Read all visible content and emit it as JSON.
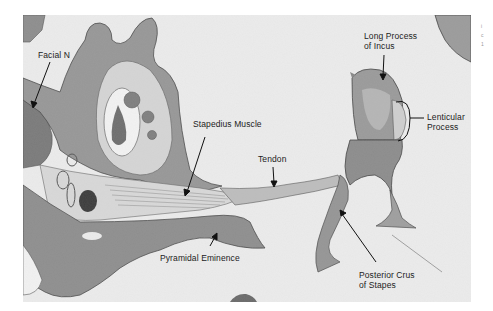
{
  "figure": {
    "background_color": "#ededed",
    "tissue_color": "#8a8a8a",
    "bone_color": "#9b9b9b",
    "line_color": "#111111"
  },
  "labels": {
    "facial_n": "Facial N",
    "stapedius_muscle": "Stapedius Muscle",
    "tendon": "Tendon",
    "long_process_of_incus": [
      "Long Process",
      "of Incus"
    ],
    "lenticular_process": [
      "Lenticular",
      "Process"
    ],
    "posterior_crus_of_stapes": [
      "Posterior Crus",
      "of Stapes"
    ],
    "pyramidal_eminence": "Pyramidal Eminence"
  },
  "edge_marks": [
    "i",
    "c",
    "1"
  ]
}
